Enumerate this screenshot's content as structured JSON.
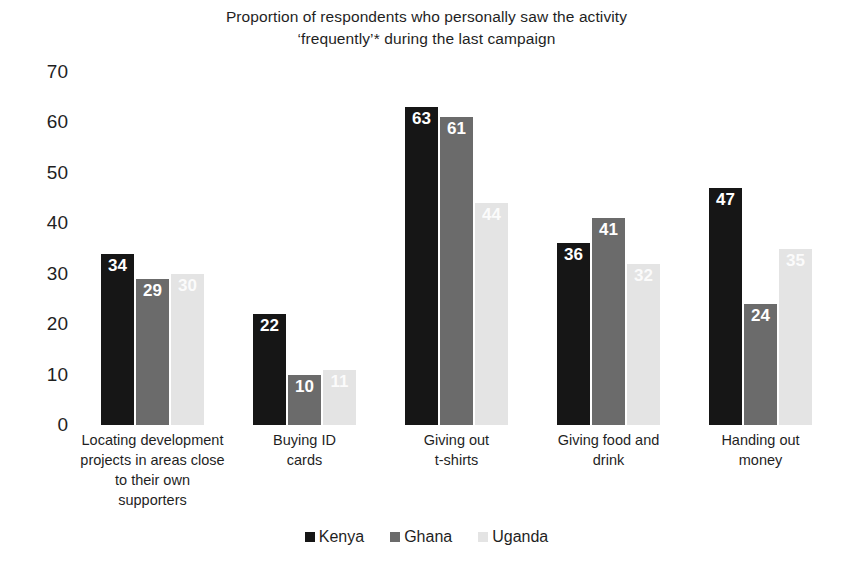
{
  "chart_data": {
    "type": "bar",
    "title_lines": [
      "Proportion of respondents who personally saw the activity",
      "‘frequently’* during the last campaign"
    ],
    "xlabel": "",
    "ylabel": "",
    "ylim": [
      0,
      70
    ],
    "yticks": [
      70,
      60,
      50,
      40,
      30,
      20,
      10,
      0
    ],
    "grid": false,
    "legend_position": "bottom",
    "categories": [
      "Locating development projects in areas close to their own supporters",
      "Buying ID cards",
      "Giving out t-shirts",
      "Giving food and drink",
      "Handing out money"
    ],
    "category_lines": [
      [
        "Locating development",
        "projects in areas close",
        "to their own",
        "supporters"
      ],
      [
        "Buying ID",
        "cards"
      ],
      [
        "Giving out",
        "t-shirts"
      ],
      [
        "Giving food and",
        "drink"
      ],
      [
        "Handing out",
        "money"
      ]
    ],
    "series": [
      {
        "name": "Kenya",
        "color": "#161616",
        "values": [
          34,
          22,
          63,
          36,
          47
        ]
      },
      {
        "name": "Ghana",
        "color": "#6b6b6b",
        "values": [
          29,
          10,
          61,
          41,
          24
        ]
      },
      {
        "name": "Uganda",
        "color": "#e4e4e4",
        "values": [
          30,
          11,
          44,
          32,
          35
        ]
      }
    ]
  },
  "legend": {
    "items": [
      {
        "label": "Kenya",
        "color": "#161616"
      },
      {
        "label": "Ghana",
        "color": "#6b6b6b"
      },
      {
        "label": "Uganda",
        "color": "#e4e4e4"
      }
    ]
  }
}
